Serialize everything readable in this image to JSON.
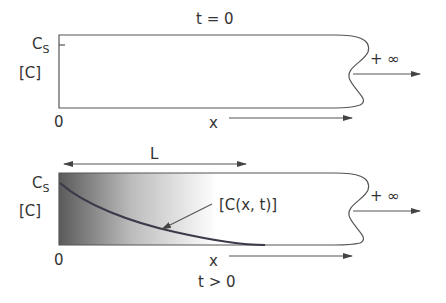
{
  "top_panel": {
    "title": "t = 0",
    "y_label_cs": "C",
    "y_label_cs_sub": "S",
    "y_label_c": "[C]",
    "origin": "0",
    "x_label": "x",
    "infinity": "+ ∞"
  },
  "bottom_panel": {
    "length_label": "L",
    "y_label_cs": "C",
    "y_label_cs_sub": "S",
    "y_label_c": "[C]",
    "origin": "0",
    "x_label": "x",
    "time_label": "t > 0",
    "curve_label": "[C(x, t)]",
    "infinity": "+ ∞"
  },
  "colors": {
    "line": "#555555",
    "curve": "#3a3a4a",
    "gradient_dark": "#555555",
    "gradient_light": "#ffffff"
  }
}
